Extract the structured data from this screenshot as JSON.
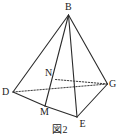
{
  "figure": {
    "caption": "図2",
    "type": "geometry-diagram",
    "colors": {
      "background": "#ffffff",
      "stroke": "#2b2b2b",
      "hidden_stroke": "#3a3a3a",
      "label": "#1a1a1a"
    },
    "vertices": [
      {
        "name": "B",
        "label": "B",
        "x": 68.5,
        "y": 15.0,
        "label_x": 65.0,
        "label_y": 2.0
      },
      {
        "name": "D",
        "label": "D",
        "x": 13.0,
        "y": 92.0,
        "label_x": 2.0,
        "label_y": 87.0
      },
      {
        "name": "G",
        "label": "G",
        "x": 107.5,
        "y": 84.0,
        "label_x": 109.0,
        "label_y": 79.0
      },
      {
        "name": "E",
        "label": "E",
        "x": 77.0,
        "y": 117.0,
        "label_x": 79.5,
        "label_y": 119.0
      },
      {
        "name": "M",
        "label": "M",
        "x": 45.0,
        "y": 106.0,
        "label_x": 40.0,
        "label_y": 107.0
      },
      {
        "name": "N",
        "label": "N",
        "x": 55.5,
        "y": 79.5,
        "label_x": 45.0,
        "label_y": 68.0
      }
    ],
    "solid_edges": [
      {
        "name": "edge-B-D",
        "from": "B",
        "to": "D"
      },
      {
        "name": "edge-B-M",
        "from": "B",
        "to": "M"
      },
      {
        "name": "edge-B-E",
        "from": "B",
        "to": "E"
      },
      {
        "name": "edge-B-G",
        "from": "B",
        "to": "G"
      },
      {
        "name": "edge-D-M",
        "from": "D",
        "to": "M"
      },
      {
        "name": "edge-M-E",
        "from": "M",
        "to": "E"
      },
      {
        "name": "edge-E-G",
        "from": "E",
        "to": "G"
      }
    ],
    "dotted_edges": [
      {
        "name": "edge-D-G",
        "from": "D",
        "to": "G"
      },
      {
        "name": "edge-N-G",
        "from": "N",
        "to": "G"
      }
    ]
  }
}
